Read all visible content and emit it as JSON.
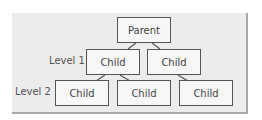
{
  "diagram": {
    "type": "hierarchy",
    "root": {
      "label": "Parent"
    },
    "levels": [
      {
        "label": "Level 1",
        "nodes": [
          {
            "label": "Child"
          },
          {
            "label": "Child"
          }
        ]
      },
      {
        "label": "Level 2",
        "nodes": [
          {
            "label": "Child"
          },
          {
            "label": "Child"
          },
          {
            "label": "Child"
          }
        ]
      }
    ],
    "colors": {
      "panel": "#ececec",
      "box_border": "#555555",
      "box_fill": "#f7f7f7",
      "shadow": "#a8a8a8"
    }
  }
}
